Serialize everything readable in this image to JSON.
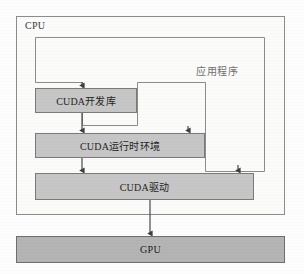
{
  "figure": {
    "type": "block-diagram",
    "colors": {
      "page_background": "#fdfdfd",
      "cpu_fill": "#fbfbfa",
      "cpu_border": "#8c8c8c",
      "layer_fill": "#c6c6c6",
      "layer_border": "#7a7a7a",
      "gpu_fill": "#b4b4b4",
      "gpu_border": "#6e6e6e",
      "connector": "#4a4a4a",
      "label_text": "#1f1f1f",
      "muted_text": "#6f6f6f"
    }
  },
  "cpu": {
    "label": "CPU"
  },
  "application": {
    "label": "应用程序"
  },
  "layers": [
    {
      "id": "dev-lib",
      "label": "CUDA开发库"
    },
    {
      "id": "runtime",
      "label": "CUDA运行时环境"
    },
    {
      "id": "driver",
      "label": "CUDA驱动"
    }
  ],
  "gpu": {
    "label": "GPU"
  },
  "connections": [
    {
      "from": "application",
      "to": "dev-lib",
      "style": "arrow-down"
    },
    {
      "from": "application",
      "to": "runtime",
      "style": "arrow-down-routed"
    },
    {
      "from": "application",
      "to": "driver",
      "style": "arrow-down-routed"
    },
    {
      "from": "dev-lib",
      "to": "runtime",
      "style": "arrow-down"
    },
    {
      "from": "runtime",
      "to": "driver",
      "style": "arrow-down"
    },
    {
      "from": "driver",
      "to": "gpu",
      "style": "arrow-down"
    }
  ]
}
